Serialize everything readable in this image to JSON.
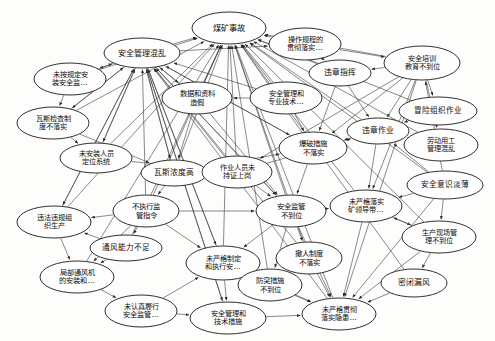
{
  "diagram": {
    "type": "directed-network-graph",
    "background_color": "#fdfdfc",
    "node_fill": "#fefefe",
    "node_stroke": "#1a1a1a",
    "edge_color": "#3b3b3b",
    "canvas": {
      "width": 495,
      "height": 341
    }
  },
  "nodes": [
    {
      "id": "n1",
      "label": "煤矿事故",
      "lines": [
        "煤矿事故"
      ],
      "cx": 229,
      "cy": 28,
      "rx": 37,
      "ry": 16,
      "font": 8.2
    },
    {
      "id": "n2",
      "label": "安全管理混乱",
      "lines": [
        "安全管理混乱"
      ],
      "cx": 142,
      "cy": 53,
      "rx": 38,
      "ry": 15,
      "font": 8.0
    },
    {
      "id": "n3",
      "label": "操作规程的贯彻落实…",
      "lines": [
        "操作规程的",
        "贯彻落实…"
      ],
      "cx": 305,
      "cy": 44,
      "rx": 36,
      "ry": 16,
      "font": 7.2
    },
    {
      "id": "n4",
      "label": "安全培训教育不到位",
      "lines": [
        "安全培训",
        "教育不到位"
      ],
      "cx": 422,
      "cy": 63,
      "rx": 38,
      "ry": 17,
      "font": 7.2
    },
    {
      "id": "n5",
      "label": "未按规定安装安全监…",
      "lines": [
        "未按规定安",
        "装安全监…"
      ],
      "cx": 70,
      "cy": 79,
      "rx": 36,
      "ry": 16,
      "font": 7.2
    },
    {
      "id": "n6",
      "label": "数据和资料造假",
      "lines": [
        "数据和资料",
        "造假"
      ],
      "cx": 197,
      "cy": 98,
      "rx": 35,
      "ry": 16,
      "font": 7.4
    },
    {
      "id": "n7",
      "label": "安全管理和专业技术…",
      "lines": [
        "安全管理和",
        "专业技术…"
      ],
      "cx": 286,
      "cy": 98,
      "rx": 36,
      "ry": 16,
      "font": 7.2
    },
    {
      "id": "n8",
      "label": "违章指挥",
      "lines": [
        "违章指挥"
      ],
      "cx": 340,
      "cy": 73,
      "rx": 31,
      "ry": 13,
      "font": 7.8
    },
    {
      "id": "n9",
      "label": "冒险组织作业",
      "lines": [
        "冒险组织作业"
      ],
      "cx": 438,
      "cy": 111,
      "rx": 39,
      "ry": 14,
      "font": 7.6
    },
    {
      "id": "n10",
      "label": "瓦斯检查制度不落实",
      "lines": [
        "瓦斯检查制",
        "度不落实"
      ],
      "cx": 53,
      "cy": 123,
      "rx": 36,
      "ry": 16,
      "font": 7.2
    },
    {
      "id": "n11",
      "label": "爆破措施不落实",
      "lines": [
        "爆破措施",
        "不落实"
      ],
      "cx": 313,
      "cy": 148,
      "rx": 34,
      "ry": 16,
      "font": 7.4
    },
    {
      "id": "n12",
      "label": "违章作业",
      "lines": [
        "违章作业"
      ],
      "cx": 378,
      "cy": 131,
      "rx": 31,
      "ry": 13,
      "font": 7.8
    },
    {
      "id": "n13",
      "label": "劳动用工管理混乱",
      "lines": [
        "劳动用工",
        "管理混乱"
      ],
      "cx": 441,
      "cy": 145,
      "rx": 37,
      "ry": 16,
      "font": 7.2
    },
    {
      "id": "n14",
      "label": "未安装人员定位系统",
      "lines": [
        "未安装人员",
        "定位系统"
      ],
      "cx": 96,
      "cy": 158,
      "rx": 36,
      "ry": 15,
      "font": 7.2
    },
    {
      "id": "n15",
      "label": "瓦斯浓度高",
      "lines": [
        "瓦斯浓度高"
      ],
      "cx": 174,
      "cy": 173,
      "rx": 33,
      "ry": 13,
      "font": 7.8
    },
    {
      "id": "n16",
      "label": "作业人员未持证上岗",
      "lines": [
        "作业人员未",
        "持证上岗"
      ],
      "cx": 237,
      "cy": 172,
      "rx": 35,
      "ry": 16,
      "font": 7.2
    },
    {
      "id": "n17",
      "label": "安全意识淡薄",
      "lines": [
        "安全意识淡薄"
      ],
      "cx": 445,
      "cy": 185,
      "rx": 38,
      "ry": 14,
      "font": 7.6
    },
    {
      "id": "n18",
      "label": "安全监管不到位",
      "lines": [
        "安全监管",
        "不到位"
      ],
      "cx": 291,
      "cy": 211,
      "rx": 35,
      "ry": 16,
      "font": 7.4
    },
    {
      "id": "n19",
      "label": "未严格落实矿领导带…",
      "lines": [
        "未严格落实",
        "矿领导带…"
      ],
      "cx": 366,
      "cy": 206,
      "rx": 36,
      "ry": 16,
      "font": 7.2
    },
    {
      "id": "n20",
      "label": "不执行监管指令",
      "lines": [
        "不执行监",
        "管指令"
      ],
      "cx": 146,
      "cy": 211,
      "rx": 33,
      "ry": 16,
      "font": 7.4
    },
    {
      "id": "n21",
      "label": "违法违规组织生仪",
      "lines": [
        "违法违规组",
        "织生产"
      ],
      "cx": 54,
      "cy": 222,
      "rx": 37,
      "ry": 16,
      "font": 7.2
    },
    {
      "id": "n22",
      "label": "生产现场管理不到位",
      "lines": [
        "生产现场管",
        "理不到位"
      ],
      "cx": 439,
      "cy": 237,
      "rx": 37,
      "ry": 16,
      "font": 7.2
    },
    {
      "id": "n23",
      "label": "通风能力不足",
      "lines": [
        "通风能力不足"
      ],
      "cx": 126,
      "cy": 248,
      "rx": 36,
      "ry": 13,
      "font": 7.6
    },
    {
      "id": "n24",
      "label": "未严格制定和执行安…",
      "lines": [
        "未严格制定",
        "和执行安…"
      ],
      "cx": 223,
      "cy": 263,
      "rx": 37,
      "ry": 17,
      "font": 7.2
    },
    {
      "id": "n25",
      "label": "撤人制度不落实",
      "lines": [
        "撤人制度",
        "不落实"
      ],
      "cx": 309,
      "cy": 258,
      "rx": 33,
      "ry": 16,
      "font": 7.4
    },
    {
      "id": "n26",
      "label": "局部通风机的安装和…",
      "lines": [
        "局部通风机",
        "的安装和…"
      ],
      "cx": 77,
      "cy": 277,
      "rx": 37,
      "ry": 16,
      "font": 7.2
    },
    {
      "id": "n27",
      "label": "防突措施不到位",
      "lines": [
        "防突措施",
        "不到位"
      ],
      "cx": 270,
      "cy": 285,
      "rx": 32,
      "ry": 16,
      "font": 7.4
    },
    {
      "id": "n28",
      "label": "密闭漏风",
      "lines": [
        "密闭漏风"
      ],
      "cx": 414,
      "cy": 283,
      "rx": 33,
      "ry": 14,
      "font": 7.8
    },
    {
      "id": "n29",
      "label": "未认真履行安全监管…",
      "lines": [
        "未认真履行",
        "安全监管…"
      ],
      "cx": 141,
      "cy": 311,
      "rx": 36,
      "ry": 16,
      "font": 7.2
    },
    {
      "id": "n30",
      "label": "安全管理和技术措施",
      "lines": [
        "安全管理和",
        "技术措施"
      ],
      "cx": 228,
      "cy": 318,
      "rx": 38,
      "ry": 16,
      "font": 7.2
    },
    {
      "id": "n31",
      "label": "未严格贯彻落实隐患…",
      "lines": [
        "未严格贯彻",
        "落实隐患…"
      ],
      "cx": 339,
      "cy": 314,
      "rx": 37,
      "ry": 16,
      "font": 7.2
    }
  ],
  "edges": [
    {
      "from": "n2",
      "to": "n1"
    },
    {
      "from": "n3",
      "to": "n1"
    },
    {
      "from": "n4",
      "to": "n1"
    },
    {
      "from": "n5",
      "to": "n1"
    },
    {
      "from": "n6",
      "to": "n1"
    },
    {
      "from": "n7",
      "to": "n1"
    },
    {
      "from": "n8",
      "to": "n1"
    },
    {
      "from": "n9",
      "to": "n1"
    },
    {
      "from": "n10",
      "to": "n1"
    },
    {
      "from": "n11",
      "to": "n1"
    },
    {
      "from": "n12",
      "to": "n1"
    },
    {
      "from": "n13",
      "to": "n1"
    },
    {
      "from": "n14",
      "to": "n1"
    },
    {
      "from": "n15",
      "to": "n1"
    },
    {
      "from": "n16",
      "to": "n1"
    },
    {
      "from": "n17",
      "to": "n1"
    },
    {
      "from": "n18",
      "to": "n1"
    },
    {
      "from": "n19",
      "to": "n1"
    },
    {
      "from": "n20",
      "to": "n1"
    },
    {
      "from": "n21",
      "to": "n1"
    },
    {
      "from": "n22",
      "to": "n1"
    },
    {
      "from": "n23",
      "to": "n1"
    },
    {
      "from": "n24",
      "to": "n1"
    },
    {
      "from": "n25",
      "to": "n1"
    },
    {
      "from": "n26",
      "to": "n1"
    },
    {
      "from": "n27",
      "to": "n1"
    },
    {
      "from": "n28",
      "to": "n1"
    },
    {
      "from": "n31",
      "to": "n1"
    },
    {
      "from": "n5",
      "to": "n2"
    },
    {
      "from": "n6",
      "to": "n2"
    },
    {
      "from": "n7",
      "to": "n2"
    },
    {
      "from": "n10",
      "to": "n2"
    },
    {
      "from": "n11",
      "to": "n2"
    },
    {
      "from": "n14",
      "to": "n2"
    },
    {
      "from": "n15",
      "to": "n2"
    },
    {
      "from": "n16",
      "to": "n2"
    },
    {
      "from": "n18",
      "to": "n2"
    },
    {
      "from": "n20",
      "to": "n2"
    },
    {
      "from": "n21",
      "to": "n2"
    },
    {
      "from": "n24",
      "to": "n2"
    },
    {
      "from": "n25",
      "to": "n2"
    },
    {
      "from": "n30",
      "to": "n2"
    },
    {
      "from": "n31",
      "to": "n2"
    },
    {
      "from": "n2",
      "to": "n3"
    },
    {
      "from": "n4",
      "to": "n8"
    },
    {
      "from": "n4",
      "to": "n9"
    },
    {
      "from": "n4",
      "to": "n12"
    },
    {
      "from": "n4",
      "to": "n13"
    },
    {
      "from": "n4",
      "to": "n16"
    },
    {
      "from": "n4",
      "to": "n11"
    },
    {
      "from": "n4",
      "to": "n19"
    },
    {
      "from": "n4",
      "to": "n31"
    },
    {
      "from": "n17",
      "to": "n4"
    },
    {
      "from": "n17",
      "to": "n22"
    },
    {
      "from": "n17",
      "to": "n12"
    },
    {
      "from": "n17",
      "to": "n31"
    },
    {
      "from": "n2",
      "to": "n5"
    },
    {
      "from": "n2",
      "to": "n6"
    },
    {
      "from": "n2",
      "to": "n10"
    },
    {
      "from": "n2",
      "to": "n14"
    },
    {
      "from": "n2",
      "to": "n15"
    },
    {
      "from": "n2",
      "to": "n11"
    },
    {
      "from": "n2",
      "to": "n21"
    },
    {
      "from": "n2",
      "to": "n18"
    },
    {
      "from": "n2",
      "to": "n24"
    },
    {
      "from": "n2",
      "to": "n30"
    },
    {
      "from": "n5",
      "to": "n10"
    },
    {
      "from": "n10",
      "to": "n15"
    },
    {
      "from": "n10",
      "to": "n14"
    },
    {
      "from": "n14",
      "to": "n16"
    },
    {
      "from": "n15",
      "to": "n11"
    },
    {
      "from": "n16",
      "to": "n12"
    },
    {
      "from": "n20",
      "to": "n21"
    },
    {
      "from": "n20",
      "to": "n23"
    },
    {
      "from": "n20",
      "to": "n26"
    },
    {
      "from": "n20",
      "to": "n24"
    },
    {
      "from": "n20",
      "to": "n18"
    },
    {
      "from": "n21",
      "to": "n26"
    },
    {
      "from": "n23",
      "to": "n26"
    },
    {
      "from": "n23",
      "to": "n21"
    },
    {
      "from": "n18",
      "to": "n19"
    },
    {
      "from": "n18",
      "to": "n25"
    },
    {
      "from": "n18",
      "to": "n31"
    },
    {
      "from": "n18",
      "to": "n27"
    },
    {
      "from": "n18",
      "to": "n24"
    },
    {
      "from": "n19",
      "to": "n31"
    },
    {
      "from": "n19",
      "to": "n22"
    },
    {
      "from": "n22",
      "to": "n28"
    },
    {
      "from": "n22",
      "to": "n31"
    },
    {
      "from": "n25",
      "to": "n31"
    },
    {
      "from": "n27",
      "to": "n31"
    },
    {
      "from": "n24",
      "to": "n30"
    },
    {
      "from": "n24",
      "to": "n31"
    },
    {
      "from": "n24",
      "to": "n27"
    },
    {
      "from": "n29",
      "to": "n30"
    },
    {
      "from": "n29",
      "to": "n24"
    },
    {
      "from": "n26",
      "to": "n29"
    },
    {
      "from": "n30",
      "to": "n31"
    },
    {
      "from": "n12",
      "to": "n11"
    },
    {
      "from": "n12",
      "to": "n19"
    },
    {
      "from": "n8",
      "to": "n12"
    },
    {
      "from": "n8",
      "to": "n11"
    },
    {
      "from": "n7",
      "to": "n11"
    },
    {
      "from": "n7",
      "to": "n6"
    },
    {
      "from": "n6",
      "to": "n15"
    },
    {
      "from": "n6",
      "to": "n18"
    },
    {
      "from": "n11",
      "to": "n18"
    },
    {
      "from": "n16",
      "to": "n18"
    },
    {
      "from": "n15",
      "to": "n20"
    },
    {
      "from": "n13",
      "to": "n12"
    },
    {
      "from": "n9",
      "to": "n12"
    },
    {
      "from": "n28",
      "to": "n31"
    },
    {
      "from": "n3",
      "to": "n8"
    },
    {
      "from": "n3",
      "to": "n4"
    },
    {
      "from": "n22",
      "to": "n19"
    },
    {
      "from": "n17",
      "to": "n19"
    }
  ]
}
